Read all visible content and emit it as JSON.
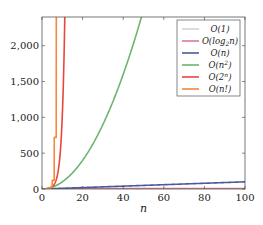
{
  "chart_data": {
    "type": "line",
    "title": "",
    "xlabel": "n",
    "ylabel": "",
    "xlim": [
      0,
      100
    ],
    "ylim": [
      0,
      2400
    ],
    "grid": false,
    "legend_position": "upper right",
    "x_ticks": [
      0,
      20,
      40,
      60,
      80,
      100
    ],
    "x_tick_labels": [
      "0",
      "20",
      "40",
      "60",
      "80",
      "100"
    ],
    "y_ticks": [
      0,
      500,
      1000,
      1500,
      2000
    ],
    "y_tick_labels": [
      "0",
      "500",
      "1,000",
      "1,500",
      "2,000"
    ],
    "series": [
      {
        "name": "O(1)",
        "label_main": "O(1)",
        "color": "#d3d3d3",
        "function": "constant"
      },
      {
        "name": "O(log2 n)",
        "label_main": "O(log",
        "label_sub": "2",
        "label_tail": "n)",
        "color": "#d97a95",
        "function": "log2"
      },
      {
        "name": "O(n)",
        "label_main": "O(n)",
        "color": "#4a5a9a",
        "function": "linear"
      },
      {
        "name": "O(n^2)",
        "label_main": "O(n",
        "label_sup": "2",
        "label_tail": ")",
        "color": "#6db36d",
        "function": "quadratic"
      },
      {
        "name": "O(2^n)",
        "label_main": "O(2",
        "label_sup": "n",
        "label_tail": ")",
        "color": "#e8483a",
        "function": "exponential"
      },
      {
        "name": "O(n!)",
        "label_main": "O(n!)",
        "color": "#f5883c",
        "function": "factorial"
      }
    ]
  }
}
